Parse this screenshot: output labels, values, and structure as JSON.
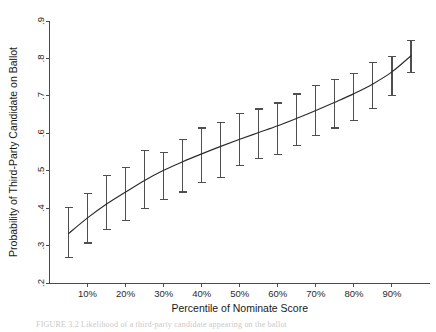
{
  "figure": {
    "caption_partial": "FIGURE 3.2  Likelihood of a third-party candidate appearing on the ballot"
  },
  "chart_data": {
    "type": "line",
    "title": "",
    "subtitle": "",
    "xlabel": "Percentile of Nominate Score",
    "ylabel": "Probability of Third-Party Candidate on Ballot",
    "xlim": [
      0,
      100
    ],
    "ylim": [
      0.2,
      0.9
    ],
    "grid": false,
    "legend": null,
    "xtick_labels": [
      "10%",
      "20%",
      "30%",
      "40%",
      "50%",
      "60%",
      "70%",
      "80%",
      "90%"
    ],
    "xtick_values": [
      10,
      20,
      30,
      40,
      50,
      60,
      70,
      80,
      90
    ],
    "ytick_labels": [
      ".2",
      ".3",
      ".4",
      ".5",
      ".6",
      ".7",
      ".8",
      ".9"
    ],
    "ytick_values": [
      0.2,
      0.3,
      0.4,
      0.5,
      0.6,
      0.7,
      0.8,
      0.9
    ],
    "error_bar_style": "capped-vertical",
    "x": [
      5,
      10,
      15,
      20,
      25,
      30,
      35,
      40,
      45,
      50,
      55,
      60,
      65,
      70,
      75,
      80,
      85,
      90,
      95
    ],
    "values": [
      0.332,
      0.374,
      0.411,
      0.443,
      0.474,
      0.501,
      0.524,
      0.545,
      0.565,
      0.584,
      0.602,
      0.62,
      0.64,
      0.661,
      0.683,
      0.706,
      0.732,
      0.764,
      0.807
    ],
    "error_low": [
      0.268,
      0.307,
      0.344,
      0.366,
      0.398,
      0.424,
      0.443,
      0.468,
      0.482,
      0.515,
      0.532,
      0.544,
      0.567,
      0.594,
      0.614,
      0.633,
      0.666,
      0.702,
      0.762
    ],
    "error_high": [
      0.401,
      0.44,
      0.487,
      0.509,
      0.555,
      0.548,
      0.583,
      0.614,
      0.629,
      0.652,
      0.665,
      0.681,
      0.705,
      0.727,
      0.743,
      0.76,
      0.789,
      0.806,
      0.848
    ],
    "series": [
      {
        "name": "Predicted probability",
        "values": [
          0.332,
          0.374,
          0.411,
          0.443,
          0.474,
          0.501,
          0.524,
          0.545,
          0.565,
          0.584,
          0.602,
          0.62,
          0.64,
          0.661,
          0.683,
          0.706,
          0.732,
          0.764,
          0.807
        ]
      }
    ],
    "colors": {
      "line": "#2b2b2b",
      "error_bar": "#4f4f4f",
      "axis": "#4a4a4a",
      "background": "#ffffff"
    }
  }
}
